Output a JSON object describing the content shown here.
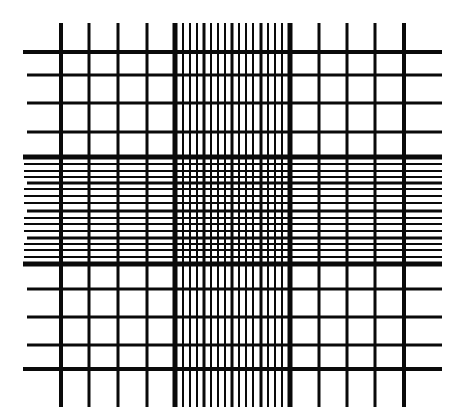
{
  "diagram": {
    "kind": "hemocytometer-counting-grid",
    "background": "#ffffff",
    "line_color": "#0a0a0a",
    "vertical_extent": {
      "y1": 23,
      "y2": 407
    },
    "horizontal_extent": {
      "x1": 23,
      "x2": 442
    },
    "vertical_lines": [
      {
        "x": 61,
        "w": 4
      },
      {
        "x": 89,
        "w": 3
      },
      {
        "x": 118,
        "w": 3
      },
      {
        "x": 147,
        "w": 3
      },
      {
        "x": 175,
        "w": 5
      },
      {
        "x": 183,
        "w": 2
      },
      {
        "x": 190,
        "w": 2
      },
      {
        "x": 197,
        "w": 2
      },
      {
        "x": 204,
        "w": 3
      },
      {
        "x": 211,
        "w": 2
      },
      {
        "x": 218,
        "w": 2
      },
      {
        "x": 225,
        "w": 2
      },
      {
        "x": 232,
        "w": 3
      },
      {
        "x": 239,
        "w": 2
      },
      {
        "x": 246,
        "w": 2
      },
      {
        "x": 253,
        "w": 2
      },
      {
        "x": 261,
        "w": 3
      },
      {
        "x": 268,
        "w": 2
      },
      {
        "x": 275,
        "w": 2
      },
      {
        "x": 282,
        "w": 2
      },
      {
        "x": 290,
        "w": 5
      },
      {
        "x": 319,
        "w": 3
      },
      {
        "x": 347,
        "w": 3
      },
      {
        "x": 375,
        "w": 3
      },
      {
        "x": 404,
        "w": 4
      }
    ],
    "horizontal_lines": [
      {
        "y": 52,
        "w": 4,
        "x1": 23
      },
      {
        "y": 75,
        "w": 3,
        "x1": 27
      },
      {
        "y": 103,
        "w": 3,
        "x1": 27
      },
      {
        "y": 132,
        "w": 3,
        "x1": 27
      },
      {
        "y": 157,
        "w": 5,
        "x1": 23
      },
      {
        "y": 164,
        "w": 2,
        "x1": 24
      },
      {
        "y": 171,
        "w": 2,
        "x1": 24
      },
      {
        "y": 177,
        "w": 2,
        "x1": 24
      },
      {
        "y": 183,
        "w": 3,
        "x1": 27
      },
      {
        "y": 189,
        "w": 2,
        "x1": 24
      },
      {
        "y": 196,
        "w": 2,
        "x1": 24
      },
      {
        "y": 203,
        "w": 2,
        "x1": 24
      },
      {
        "y": 211,
        "w": 3,
        "x1": 27
      },
      {
        "y": 218,
        "w": 2,
        "x1": 24
      },
      {
        "y": 224,
        "w": 2,
        "x1": 24
      },
      {
        "y": 231,
        "w": 2,
        "x1": 24
      },
      {
        "y": 238,
        "w": 3,
        "x1": 27
      },
      {
        "y": 244,
        "w": 2,
        "x1": 24
      },
      {
        "y": 250,
        "w": 2,
        "x1": 24
      },
      {
        "y": 257,
        "w": 2,
        "x1": 24
      },
      {
        "y": 264,
        "w": 5,
        "x1": 23
      },
      {
        "y": 289,
        "w": 3,
        "x1": 27
      },
      {
        "y": 317,
        "w": 3,
        "x1": 27
      },
      {
        "y": 345,
        "w": 3,
        "x1": 27
      },
      {
        "y": 369,
        "w": 4,
        "x1": 23
      }
    ]
  }
}
